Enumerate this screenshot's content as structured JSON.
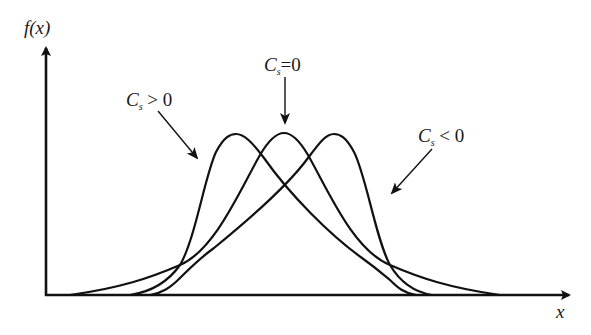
{
  "figure": {
    "type": "skewness-distribution-diagram",
    "axes": {
      "y_label": "f(x)",
      "x_label": "x"
    },
    "curves": [
      {
        "name": "positive-skew",
        "label_symbol": "C",
        "label_sub": "s",
        "label_rel": ">",
        "label_val": "0",
        "peak_position": "left"
      },
      {
        "name": "symmetric",
        "label_symbol": "C",
        "label_sub": "s",
        "label_rel": "=",
        "label_val": "0",
        "peak_position": "center"
      },
      {
        "name": "negative-skew",
        "label_symbol": "C",
        "label_sub": "s",
        "label_rel": "<",
        "label_val": "0",
        "peak_position": "right"
      }
    ],
    "colors": {
      "ink": "#111111",
      "background": "#ffffff"
    }
  }
}
